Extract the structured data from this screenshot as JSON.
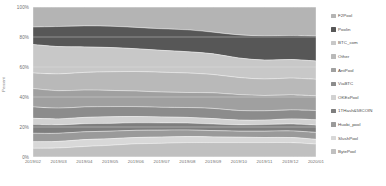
{
  "chart_data": {
    "type": "area",
    "title": "",
    "subtitle": "",
    "xlabel": "",
    "ylabel": "Percent",
    "stacked": true,
    "normalized_percent": true,
    "grid": true,
    "legend_position": "right",
    "ylim": [
      0,
      100
    ],
    "ytick_labels": [
      "0%",
      "20%",
      "40%",
      "60%",
      "80%",
      "100%"
    ],
    "ytick_values": [
      0,
      20,
      40,
      60,
      80,
      100
    ],
    "categories": [
      "2019/02",
      "2019/03",
      "2019/04",
      "2019/05",
      "2019/06",
      "2019/07",
      "2019/08",
      "2019/09",
      "2019/10",
      "2019/11",
      "2019/12",
      "2020/01"
    ],
    "series": [
      {
        "name": "F2Pool",
        "color": "#b4b4b4",
        "values": [
          13.4,
          13.0,
          12.6,
          12.8,
          13.6,
          14.5,
          15.2,
          16.8,
          18.6,
          19.2,
          19.0,
          19.4
        ]
      },
      {
        "name": "Poolin",
        "color": "#575757",
        "values": [
          11.6,
          13.4,
          14.0,
          14.2,
          14.2,
          14.4,
          14.6,
          14.4,
          15.4,
          16.2,
          16.0,
          16.6
        ]
      },
      {
        "name": "BTC_com",
        "color": "#c8c8c8",
        "values": [
          19.0,
          18.2,
          17.0,
          16.2,
          15.2,
          14.6,
          14.2,
          13.8,
          13.0,
          12.6,
          12.4,
          12.2
        ]
      },
      {
        "name": "Other",
        "color": "#b9b9b9",
        "values": [
          10.4,
          11.2,
          11.8,
          12.4,
          13.0,
          13.2,
          13.0,
          12.2,
          11.4,
          11.0,
          11.2,
          11.0
        ]
      },
      {
        "name": "AntPool",
        "color": "#a0a0a0",
        "values": [
          12.2,
          11.6,
          11.2,
          10.8,
          10.4,
          10.2,
          10.0,
          10.4,
          10.6,
          10.2,
          10.0,
          9.8
        ]
      },
      {
        "name": "ViaBTC",
        "color": "#8c8c8c",
        "values": [
          7.6,
          7.2,
          7.0,
          6.8,
          6.6,
          6.4,
          6.6,
          6.8,
          6.4,
          6.2,
          6.0,
          6.2
        ]
      },
      {
        "name": "OKExPool",
        "color": "#d2d2d2",
        "values": [
          4.2,
          4.0,
          4.2,
          4.4,
          4.2,
          4.0,
          3.8,
          3.6,
          3.2,
          3.0,
          3.4,
          3.6
        ]
      },
      {
        "name": "1THash&58COIN",
        "color": "#7e7e7e",
        "values": [
          5.8,
          5.6,
          5.4,
          5.2,
          5.0,
          4.8,
          4.6,
          4.4,
          4.2,
          4.4,
          4.6,
          4.8
        ]
      },
      {
        "name": "Huobi_pool",
        "color": "#9a9a9a",
        "values": [
          5.6,
          5.4,
          5.2,
          5.0,
          4.8,
          4.6,
          4.4,
          4.2,
          4.0,
          4.2,
          4.4,
          4.6
        ]
      },
      {
        "name": "SlushPool",
        "color": "#d8d8d8",
        "values": [
          4.4,
          4.4,
          4.6,
          4.4,
          4.2,
          4.2,
          4.0,
          3.8,
          3.6,
          3.4,
          3.4,
          3.2
        ]
      },
      {
        "name": "BytePool",
        "color": "#c0c0c0",
        "values": [
          5.8,
          6.0,
          7.0,
          7.8,
          8.8,
          9.1,
          9.6,
          9.6,
          9.6,
          9.6,
          9.6,
          8.6
        ]
      }
    ]
  },
  "axes": {
    "y_title": "Percent",
    "y_ticks": [
      "100%",
      "80%",
      "60%",
      "40%",
      "20%",
      "0%"
    ],
    "x_ticks": [
      "2019/02",
      "2019/03",
      "2019/04",
      "2019/05",
      "2019/06",
      "2019/07",
      "2019/08",
      "2019/09",
      "2019/10",
      "2019/11",
      "2019/12",
      "2020/01"
    ]
  },
  "legend": {
    "items": [
      {
        "label": "F2Pool",
        "color": "#b4b4b4"
      },
      {
        "label": "Poolin",
        "color": "#575757"
      },
      {
        "label": "BTC_com",
        "color": "#c8c8c8"
      },
      {
        "label": "Other",
        "color": "#b9b9b9"
      },
      {
        "label": "AntPool",
        "color": "#a0a0a0"
      },
      {
        "label": "ViaBTC",
        "color": "#8c8c8c"
      },
      {
        "label": "OKExPool",
        "color": "#d2d2d2"
      },
      {
        "label": "1THash&58COIN",
        "color": "#7e7e7e"
      },
      {
        "label": "Huobi_pool",
        "color": "#9a9a9a"
      },
      {
        "label": "SlushPool",
        "color": "#d8d8d8"
      },
      {
        "label": "BytePool",
        "color": "#c0c0c0"
      }
    ]
  },
  "watermark": {
    "text": ""
  },
  "colors": {
    "background": "#ffffff",
    "grid": "#e6e6e6",
    "tick_text": "#6f6f6f",
    "legend_text": "#4a4a4a"
  }
}
